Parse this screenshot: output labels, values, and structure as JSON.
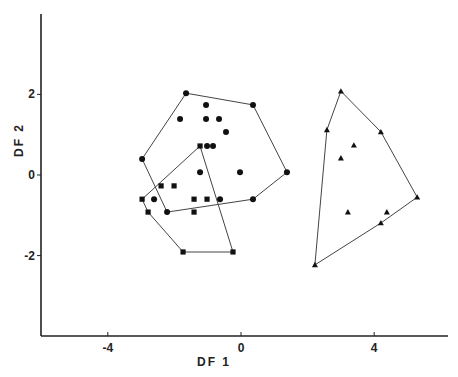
{
  "chart_data": {
    "type": "scatter",
    "title": "",
    "xlabel": "DF 1",
    "ylabel": "DF 2",
    "xlim": [
      -6.0,
      6.2
    ],
    "ylim": [
      -4.0,
      4.0
    ],
    "xticks": [
      -4,
      0,
      4
    ],
    "yticks": [
      -2,
      0,
      2
    ],
    "xtick_labels": [
      "-4",
      "0",
      "4"
    ],
    "ytick_labels": [
      "-2",
      "0",
      "2"
    ],
    "grid": false,
    "legend": null,
    "series": [
      {
        "name": "group-circles",
        "marker": "circle",
        "color": "#111111",
        "points": [
          [
            -1.65,
            2.03
          ],
          [
            0.36,
            1.74
          ],
          [
            1.38,
            0.07
          ],
          [
            0.36,
            -0.6
          ],
          [
            -2.22,
            -0.92
          ],
          [
            -2.97,
            0.4
          ],
          [
            -1.05,
            1.74
          ],
          [
            -1.83,
            1.39
          ],
          [
            -1.05,
            1.39
          ],
          [
            -0.66,
            1.39
          ],
          [
            -0.45,
            1.07
          ],
          [
            -1.02,
            0.72
          ],
          [
            -0.84,
            0.72
          ],
          [
            -1.23,
            0.07
          ],
          [
            -0.03,
            0.07
          ],
          [
            -2.61,
            -0.6
          ],
          [
            -0.63,
            -0.6
          ]
        ],
        "hull": [
          [
            -1.65,
            2.03
          ],
          [
            0.36,
            1.74
          ],
          [
            1.38,
            0.07
          ],
          [
            0.36,
            -0.6
          ],
          [
            -2.22,
            -0.92
          ],
          [
            -2.97,
            0.4
          ]
        ]
      },
      {
        "name": "group-squares",
        "marker": "square",
        "color": "#111111",
        "points": [
          [
            -1.23,
            0.72
          ],
          [
            -2.4,
            -0.27
          ],
          [
            -2.01,
            -0.27
          ],
          [
            -2.97,
            -0.6
          ],
          [
            -1.41,
            -0.6
          ],
          [
            -1.02,
            -0.6
          ],
          [
            -2.79,
            -0.92
          ],
          [
            -1.41,
            -0.92
          ],
          [
            -1.74,
            -1.91
          ],
          [
            -0.24,
            -1.91
          ]
        ],
        "hull": [
          [
            -1.23,
            0.72
          ],
          [
            -0.24,
            -1.91
          ],
          [
            -1.74,
            -1.91
          ],
          [
            -2.79,
            -0.92
          ],
          [
            -2.97,
            -0.6
          ]
        ]
      },
      {
        "name": "group-triangles",
        "marker": "triangle",
        "color": "#111111",
        "points": [
          [
            3.0,
            2.08
          ],
          [
            2.58,
            1.12
          ],
          [
            4.2,
            1.07
          ],
          [
            3.39,
            0.74
          ],
          [
            3.0,
            0.42
          ],
          [
            5.29,
            -0.55
          ],
          [
            3.21,
            -0.92
          ],
          [
            4.38,
            -0.92
          ],
          [
            4.2,
            -1.19
          ],
          [
            2.22,
            -2.23
          ]
        ],
        "hull": [
          [
            3.0,
            2.08
          ],
          [
            4.2,
            1.07
          ],
          [
            5.29,
            -0.55
          ],
          [
            4.2,
            -1.19
          ],
          [
            2.22,
            -2.23
          ],
          [
            2.58,
            1.12
          ]
        ]
      }
    ]
  },
  "layout": {
    "origin_px": [
      241,
      175
    ],
    "px_per_unit_x": 33.3,
    "px_per_unit_y": 40.3,
    "y_axis_x": 41,
    "y_axis_top": 14,
    "x_axis_y": 336,
    "x_axis_right": 448
  }
}
